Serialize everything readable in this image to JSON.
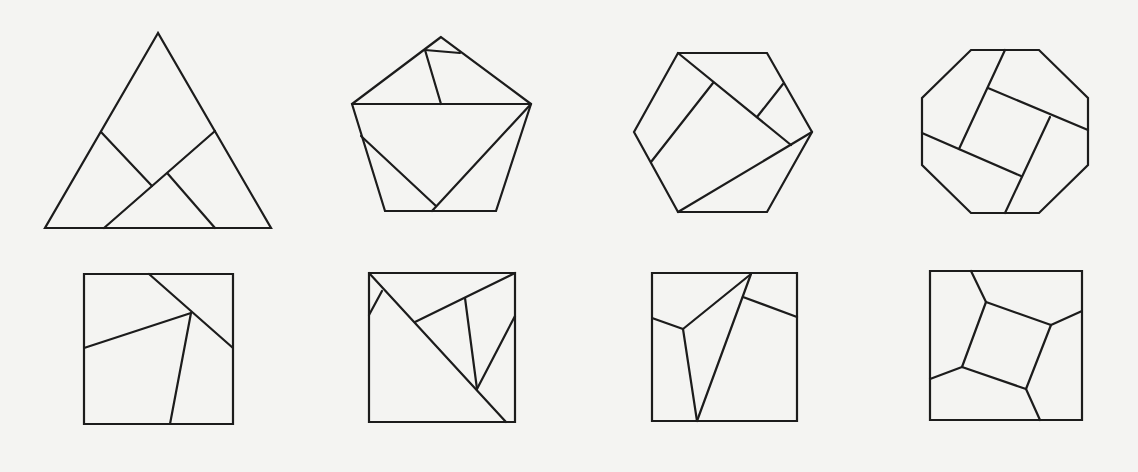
{
  "figure": {
    "stroke_color": "#1c1c1c",
    "background_color": "#f4f4f2",
    "figures": [
      {
        "name": "triangle-dissection",
        "outline": [
          [
            158,
            33
          ],
          [
            45,
            228
          ],
          [
            271,
            228
          ]
        ],
        "cuts": [
          [
            [
              101,
              132
            ],
            [
              152,
              186
            ]
          ],
          [
            [
              215,
              131
            ],
            [
              104,
              228
            ]
          ],
          [
            [
              168,
              174
            ],
            [
              215,
              228
            ]
          ]
        ]
      },
      {
        "name": "pentagon-dissection",
        "outline": [
          [
            441,
            37
          ],
          [
            352,
            104
          ],
          [
            385,
            211
          ],
          [
            496,
            211
          ],
          [
            531,
            104
          ]
        ],
        "cuts": [
          [
            [
              352,
              104
            ],
            [
              531,
              104
            ]
          ],
          [
            [
              425,
              50
            ],
            [
              460,
              53
            ]
          ],
          [
            [
              425,
              50
            ],
            [
              441,
              104
            ]
          ],
          [
            [
              361,
              136
            ],
            [
              436,
              206
            ]
          ],
          [
            [
              531,
              104
            ],
            [
              432,
              211
            ]
          ]
        ]
      },
      {
        "name": "hexagon-dissection",
        "outline": [
          [
            678,
            53
          ],
          [
            767,
            53
          ],
          [
            812,
            132
          ],
          [
            767,
            212
          ],
          [
            678,
            212
          ],
          [
            634,
            132
          ]
        ],
        "cuts": [
          [
            [
              678,
              53
            ],
            [
              791,
              145
            ]
          ],
          [
            [
              713,
              83
            ],
            [
              651,
              162
            ]
          ],
          [
            [
              783,
              84
            ],
            [
              757,
              117
            ]
          ],
          [
            [
              812,
              132
            ],
            [
              678,
              212
            ]
          ]
        ]
      },
      {
        "name": "octagon-dissection",
        "outline": [
          [
            971,
            50
          ],
          [
            1039,
            50
          ],
          [
            1088,
            98
          ],
          [
            1088,
            165
          ],
          [
            1039,
            213
          ],
          [
            971,
            213
          ],
          [
            922,
            165
          ],
          [
            922,
            98
          ]
        ],
        "cuts": [
          [
            [
              1005,
              50
            ],
            [
              959,
              149
            ]
          ],
          [
            [
              988,
              88
            ],
            [
              1088,
              130
            ]
          ],
          [
            [
              1050,
              117
            ],
            [
              1005,
              213
            ]
          ],
          [
            [
              922,
              133
            ],
            [
              1021,
              176
            ]
          ]
        ]
      },
      {
        "name": "square-dissection-1",
        "outline": [
          [
            84,
            274
          ],
          [
            233,
            274
          ],
          [
            233,
            424
          ],
          [
            84,
            424
          ]
        ],
        "cuts": [
          [
            [
              149,
              274
            ],
            [
              233,
              348
            ]
          ],
          [
            [
              84,
              348
            ],
            [
              191,
              313
            ]
          ],
          [
            [
              191,
              313
            ],
            [
              170,
              424
            ]
          ]
        ]
      },
      {
        "name": "square-dissection-2",
        "outline": [
          [
            369,
            273
          ],
          [
            515,
            273
          ],
          [
            515,
            422
          ],
          [
            369,
            422
          ]
        ],
        "cuts": [
          [
            [
              369,
              273
            ],
            [
              506,
              422
            ]
          ],
          [
            [
              369,
              315
            ],
            [
              382,
              291
            ]
          ],
          [
            [
              415,
              322
            ],
            [
              515,
              273
            ]
          ],
          [
            [
              465,
              298
            ],
            [
              477,
              389
            ]
          ],
          [
            [
              477,
              389
            ],
            [
              515,
              316
            ]
          ]
        ]
      },
      {
        "name": "square-dissection-3",
        "outline": [
          [
            652,
            273
          ],
          [
            797,
            273
          ],
          [
            797,
            421
          ],
          [
            652,
            421
          ]
        ],
        "cuts": [
          [
            [
              652,
              318
            ],
            [
              683,
              329
            ]
          ],
          [
            [
              683,
              329
            ],
            [
              751,
              274
            ]
          ],
          [
            [
              683,
              329
            ],
            [
              697,
              421
            ]
          ],
          [
            [
              751,
              274
            ],
            [
              697,
              421
            ]
          ],
          [
            [
              743,
              297
            ],
            [
              797,
              317
            ]
          ]
        ]
      },
      {
        "name": "square-dissection-4",
        "outline": [
          [
            930,
            271
          ],
          [
            1082,
            271
          ],
          [
            1082,
            420
          ],
          [
            930,
            420
          ]
        ],
        "cuts": [
          [
            [
              971,
              271
            ],
            [
              986,
              302
            ]
          ],
          [
            [
              986,
              302
            ],
            [
              1051,
              325
            ]
          ],
          [
            [
              1051,
              325
            ],
            [
              1082,
              311
            ]
          ],
          [
            [
              1051,
              325
            ],
            [
              1026,
              389
            ]
          ],
          [
            [
              1026,
              389
            ],
            [
              1040,
              420
            ]
          ],
          [
            [
              1026,
              389
            ],
            [
              962,
              367
            ]
          ],
          [
            [
              962,
              367
            ],
            [
              930,
              379
            ]
          ],
          [
            [
              962,
              367
            ],
            [
              986,
              302
            ]
          ]
        ]
      }
    ]
  }
}
